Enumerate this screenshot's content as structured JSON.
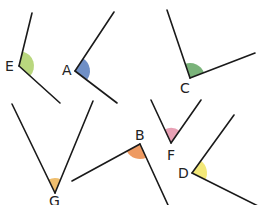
{
  "diagram": {
    "type": "angles",
    "angles": [
      {
        "label": "E",
        "color": "#b9d77e",
        "vertex": [
          19,
          66
        ],
        "ray1": [
          32,
          13
        ],
        "ray2": [
          60,
          103
        ],
        "label_pos": [
          5,
          59
        ]
      },
      {
        "label": "A",
        "color": "#6f8fc6",
        "vertex": [
          75,
          71
        ],
        "ray1": [
          114,
          12
        ],
        "ray2": [
          117,
          103
        ],
        "label_pos": [
          62,
          63
        ]
      },
      {
        "label": "C",
        "color": "#7ab37a",
        "vertex": [
          190,
          78
        ],
        "ray1": [
          167,
          10
        ],
        "ray2": [
          255,
          53
        ],
        "label_pos": [
          180,
          81
        ]
      },
      {
        "label": "G",
        "color": "#efbe6e",
        "vertex": [
          55,
          193
        ],
        "ray1": [
          12,
          104
        ],
        "ray2": [
          93,
          101
        ],
        "label_pos": [
          49,
          194
        ]
      },
      {
        "label": "B",
        "color": "#ee9a62",
        "vertex": [
          140,
          144
        ],
        "ray1": [
          72,
          181
        ],
        "ray2": [
          168,
          205
        ],
        "label_pos": [
          135,
          128
        ]
      },
      {
        "label": "F",
        "color": "#e8a1b5",
        "vertex": [
          171,
          143
        ],
        "ray1": [
          151,
          100
        ],
        "ray2": [
          201,
          100
        ],
        "label_pos": [
          167,
          148
        ]
      },
      {
        "label": "D",
        "color": "#f3e879",
        "vertex": [
          192,
          173
        ],
        "ray1": [
          234,
          115
        ],
        "ray2": [
          258,
          206
        ],
        "label_pos": [
          178,
          166
        ]
      }
    ]
  }
}
